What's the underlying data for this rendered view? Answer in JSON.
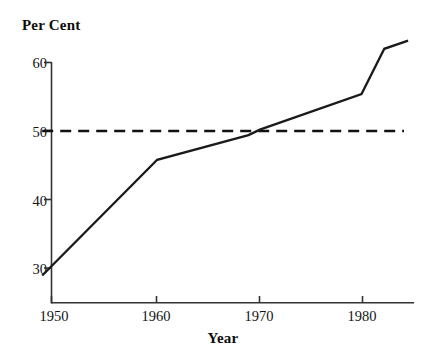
{
  "chart_data": {
    "type": "line",
    "title": "",
    "subtitle": "",
    "xlabel": "Year",
    "ylabel": "Per Cent",
    "xlim": [
      1949,
      1984.5
    ],
    "ylim": [
      25.5,
      64.5
    ],
    "xticks": [
      1950,
      1960,
      1970,
      1980
    ],
    "xtick_labels": [
      "1950",
      "1960",
      "1970",
      "1980"
    ],
    "yticks": [
      30,
      40,
      50,
      60
    ],
    "ytick_labels": [
      "30",
      "40",
      "50",
      "60"
    ],
    "grid": false,
    "legend": null,
    "series": [
      {
        "name": "Per Cent",
        "style": "solid",
        "color": "#1a1a1a",
        "x": [
          1949.1,
          1960.2,
          1969.0,
          1970.1,
          1979.9,
          1982.1,
          1984.4
        ],
        "values": [
          28.9,
          45.8,
          49.4,
          50.2,
          55.4,
          62.0,
          63.2
        ]
      },
      {
        "name": "50 per cent reference",
        "style": "dashed",
        "color": "#111111",
        "x": [
          1949.1,
          1984.0
        ],
        "values": [
          50,
          50
        ]
      }
    ],
    "annotations": [],
    "reference_lines": [
      {
        "axis": "y",
        "value": 50,
        "style": "dashed"
      }
    ]
  },
  "axes": {
    "y_axis_title": "Per Cent",
    "x_axis_title": "Year"
  }
}
